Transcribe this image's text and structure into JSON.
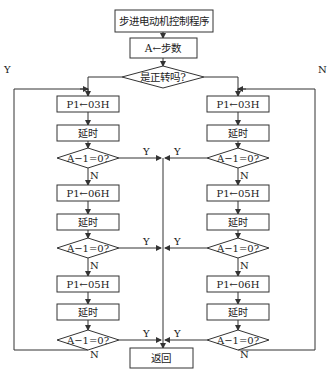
{
  "flowchart": {
    "start": "步进电动机控制程序",
    "init": "A←步数",
    "direction_decision": "是正转吗?",
    "direction_yes": "Y",
    "direction_no": "N",
    "left_branch": {
      "steps": [
        {
          "output": "P1←03H",
          "delay": "延时",
          "check": "A−1=0?"
        },
        {
          "output": "P1←06H",
          "delay": "延时",
          "check": "A−1=0?"
        },
        {
          "output": "P1←05H",
          "delay": "延时",
          "check": "A−1=0?"
        }
      ]
    },
    "right_branch": {
      "steps": [
        {
          "output": "P1←03H",
          "delay": "延时",
          "check": "A−1=0?"
        },
        {
          "output": "P1←05H",
          "delay": "延时",
          "check": "A−1=0?"
        },
        {
          "output": "P1←06H",
          "delay": "延时",
          "check": "A−1=0?"
        }
      ]
    },
    "yes_label": "Y",
    "no_label": "N",
    "end": "返回"
  },
  "colors": {
    "line": "#333333",
    "background": "#ffffff"
  }
}
